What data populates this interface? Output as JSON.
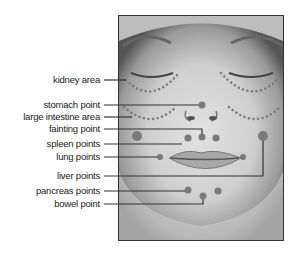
{
  "labels": [
    {
      "id": "kidney",
      "text": "kidney area",
      "y": 80
    },
    {
      "id": "stomach",
      "text": "stomach point",
      "y": 105
    },
    {
      "id": "large-intestine",
      "text": "large intestine area",
      "y": 117
    },
    {
      "id": "fainting",
      "text": "fainting point",
      "y": 129
    },
    {
      "id": "spleen",
      "text": "spleen points",
      "y": 144
    },
    {
      "id": "lung",
      "text": "lung points",
      "y": 157
    },
    {
      "id": "liver",
      "text": "liver points",
      "y": 176
    },
    {
      "id": "pancreas",
      "text": "pancreas points",
      "y": 191
    },
    {
      "id": "bowel",
      "text": "bowel point",
      "y": 204
    }
  ],
  "colors": {
    "point": "#7a7a7a",
    "line": "#333333",
    "frame": "#333333"
  }
}
